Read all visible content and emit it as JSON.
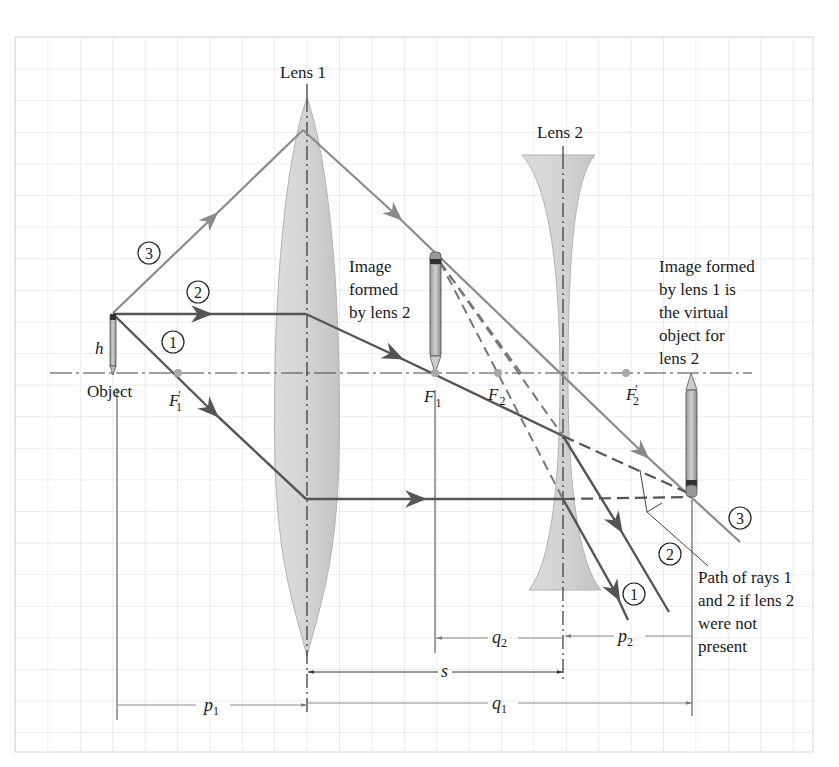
{
  "figure": {
    "type": "two-lens ray diagram (converging lens followed by diverging lens)",
    "lens1": {
      "label": "Lens 1",
      "kind": "converging"
    },
    "lens2": {
      "label": "Lens 2",
      "kind": "diverging"
    },
    "object": {
      "label": "Object",
      "height_label": "h"
    },
    "focal_points": {
      "F1_prime": {
        "main": "F",
        "sub": "1",
        "prime": "′"
      },
      "F1": {
        "main": "F",
        "sub": "1"
      },
      "F2": {
        "main": "F",
        "sub": "2"
      },
      "F2_prime": {
        "main": "F",
        "sub": "2",
        "prime": "′"
      }
    },
    "rays": [
      {
        "id": "1",
        "label": "1"
      },
      {
        "id": "2",
        "label": "2"
      },
      {
        "id": "3",
        "label": "3"
      }
    ],
    "annotations": {
      "image_lens2": [
        "Image",
        "formed",
        "by lens 2"
      ],
      "virtual_object": [
        "Image formed",
        "by lens 1 is",
        "the virtual",
        "object for",
        "lens 2"
      ],
      "path_note": [
        "Path of rays 1",
        "and 2 if lens 2",
        "were not",
        "present"
      ]
    },
    "dimensions": {
      "p1": {
        "main": "p",
        "sub": "1"
      },
      "q1": {
        "main": "q",
        "sub": "1"
      },
      "q2": {
        "main": "q",
        "sub": "2"
      },
      "p2": {
        "main": "p",
        "sub": "2"
      },
      "s": {
        "main": "s"
      }
    }
  },
  "colors": {
    "grid": "#d9d9d9",
    "ray_dark": "#555555",
    "ray_light": "#8a8a8a",
    "lens_fill": "#d6d6d6",
    "lens_fill_dark": "#c4c4c4",
    "axis": "#444444",
    "focal_dot": "#a8a8a8",
    "text": "#1a1a1a"
  }
}
